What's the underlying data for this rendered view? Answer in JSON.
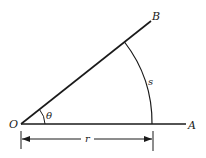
{
  "diagram": {
    "type": "geometry",
    "labels": {
      "vertex": "O",
      "ray_end_upper": "B",
      "ray_end_lower": "A",
      "angle": "θ",
      "arc": "s",
      "radius": "r"
    },
    "colors": {
      "stroke": "#1a1a1a",
      "background": "#ffffff"
    }
  }
}
